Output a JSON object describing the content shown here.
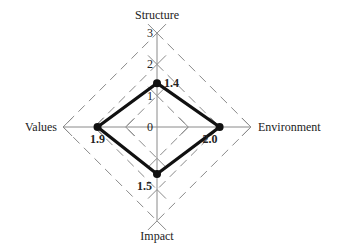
{
  "chart_data": {
    "type": "radar",
    "title": "",
    "axes": [
      "Structure",
      "Environment",
      "Impact",
      "Values"
    ],
    "values": [
      1.4,
      2.0,
      1.5,
      1.9
    ],
    "value_labels": [
      "1.4",
      "2.0",
      "1.5",
      "1.9"
    ],
    "scale_ticks": [
      "0",
      "1",
      "2",
      "3"
    ],
    "range": [
      0,
      3
    ],
    "grid": "dashed diamonds",
    "legend": "none"
  },
  "colors": {
    "series": "#111111",
    "grid": "#8a8a8a",
    "axis": "#8a8a8a",
    "text": "#222222"
  }
}
